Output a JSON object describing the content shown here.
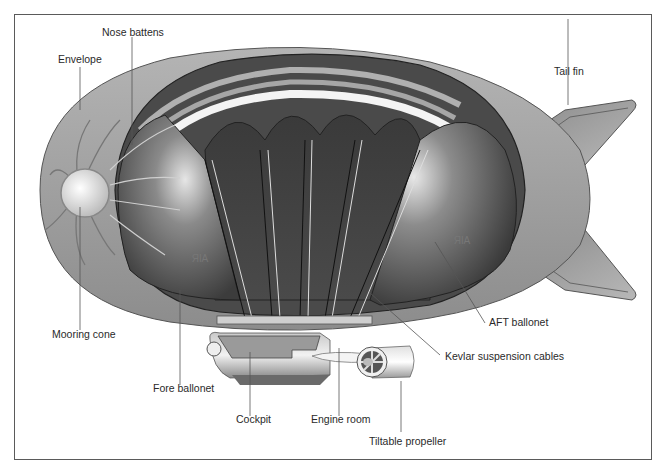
{
  "diagram": {
    "type": "cutaway-illustration",
    "colors": {
      "frame": "#5a5a5a",
      "envelope": "#9a9a9a",
      "ballonet_dark": "#3a3a3a",
      "ballonet_light": "#d8d8d8",
      "leader_line": "#555555",
      "label_text": "#2a2a2a"
    },
    "labels": {
      "nose_battens": "Nose battens",
      "envelope": "Envelope",
      "tail_fin": "Tail fin",
      "mooring_cone": "Mooring cone",
      "fore_ballonet": "Fore ballonet",
      "aft_ballonet": "AFT ballonet",
      "kevlar_cables": "Kevlar suspension cables",
      "cockpit": "Cockpit",
      "engine_room": "Engine room",
      "tiltable_propeller": "Tiltable propeller"
    },
    "inner_text": {
      "air_fore": "AIR",
      "air_aft": "AIR"
    }
  }
}
